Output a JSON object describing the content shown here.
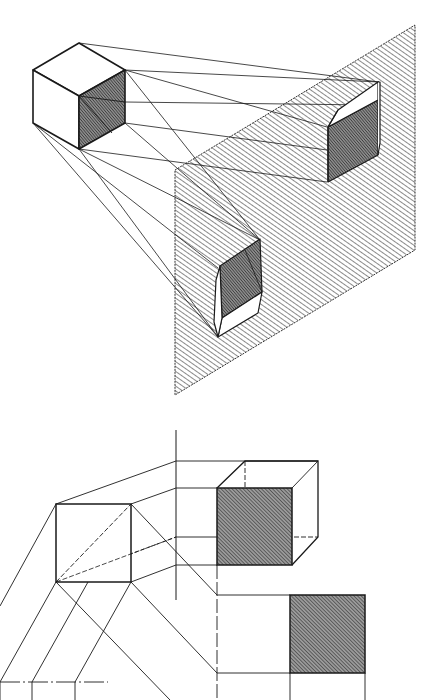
{
  "figure": {
    "title": "",
    "colors": {
      "background": "#ffffff",
      "ink": "#1a1a1a",
      "hatch": "#2a2a2a",
      "dark_face": "#5a5a5a"
    },
    "top_drawing": {
      "description": "Isometric cube with shaded face projected by parallel rays onto an inclined hatched plane, producing two prism projections",
      "cube": {
        "outline": [
          [
            33,
            70
          ],
          [
            79,
            43
          ],
          [
            125,
            70
          ],
          [
            125,
            123
          ],
          [
            79,
            149
          ],
          [
            33,
            123
          ]
        ],
        "inner_vertex": [
          79,
          96
        ],
        "shaded_face": "right"
      },
      "plane": {
        "corners": [
          [
            175,
            170
          ],
          [
            415,
            25
          ],
          [
            415,
            250
          ],
          [
            175,
            395
          ]
        ],
        "fill": "diagonal-hatch"
      },
      "projections": [
        "upper-right prism",
        "lower-left prism"
      ]
    },
    "bottom_drawing": {
      "description": "Orthographic construction: square view, vertical reference axis, oblique cube with hatched front face, and hatched square view",
      "axis_x": 176,
      "left_square": [
        56,
        504,
        131,
        582
      ],
      "cube_front_face": [
        217,
        488,
        292,
        565
      ],
      "hatched_square": [
        290,
        595,
        365,
        673
      ]
    }
  }
}
